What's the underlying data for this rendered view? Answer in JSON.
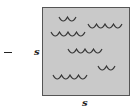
{
  "diagram": {
    "sign": "−",
    "side_label": "s",
    "bottom_label": "s",
    "square": {
      "fill": "#c9c9c9",
      "stroke": "#555555"
    },
    "wave_color": "#333333",
    "wave_groups": [
      {
        "x": 59,
        "y": 17,
        "arcs": 2
      },
      {
        "x": 88,
        "y": 24,
        "arcs": 4
      },
      {
        "x": 51,
        "y": 32,
        "arcs": 4
      },
      {
        "x": 68,
        "y": 49,
        "arcs": 4
      },
      {
        "x": 98,
        "y": 66,
        "arcs": 2
      },
      {
        "x": 53,
        "y": 75,
        "arcs": 4
      }
    ]
  }
}
